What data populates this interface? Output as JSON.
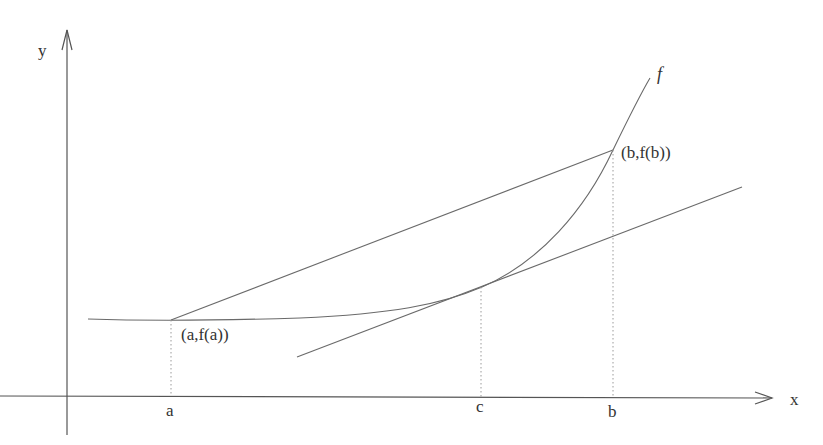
{
  "diagram": {
    "axes": {
      "x_label": "x",
      "y_label": "y"
    },
    "curve_label": "f",
    "points": {
      "a_point": "(a,f(a))",
      "b_point": "(b,f(b))"
    },
    "ticks": {
      "a": "a",
      "c": "c",
      "b": "b"
    },
    "elements": [
      "curve f",
      "secant line from (a,f(a)) to (b,f(b))",
      "tangent line at c parallel to secant",
      "dotted verticals at a, c, b"
    ],
    "colors": {
      "line": "#6a6a6a",
      "text": "#333333",
      "background": "#ffffff"
    }
  }
}
